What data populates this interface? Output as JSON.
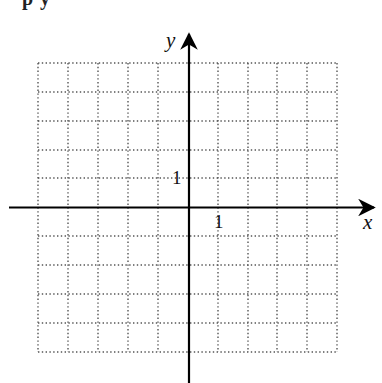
{
  "header_fragment": {
    "text": "p            y"
  },
  "graph": {
    "x_axis_label": "x",
    "y_axis_label": "y",
    "x_tick_label": "1",
    "y_tick_label": "1",
    "grid": {
      "columns": 10,
      "rows": 10,
      "x_range": [
        -5,
        5
      ],
      "y_range": [
        -5,
        5
      ],
      "style": "dotted",
      "color": "#555555"
    },
    "axis_color": "#000000"
  }
}
